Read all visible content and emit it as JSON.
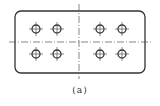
{
  "figure": {
    "caption": "(a)",
    "plate": {
      "x": 15,
      "y": 11,
      "width": 130,
      "height": 62,
      "corner_radius": 6
    },
    "center_lines": {
      "horizontal": {
        "y": 42,
        "x1": 9,
        "x2": 151
      },
      "vertical": {
        "x": 79,
        "y1": 4,
        "y2": 79
      }
    },
    "holes": [
      {
        "cx": 36,
        "cy": 29
      },
      {
        "cx": 57,
        "cy": 29
      },
      {
        "cx": 100,
        "cy": 29
      },
      {
        "cx": 122,
        "cy": 29
      },
      {
        "cx": 36,
        "cy": 54
      },
      {
        "cx": 57,
        "cy": 54
      },
      {
        "cx": 100,
        "cy": 54
      },
      {
        "cx": 122,
        "cy": 54
      }
    ],
    "hole_radius": 4,
    "stroke_color": "#333333"
  }
}
